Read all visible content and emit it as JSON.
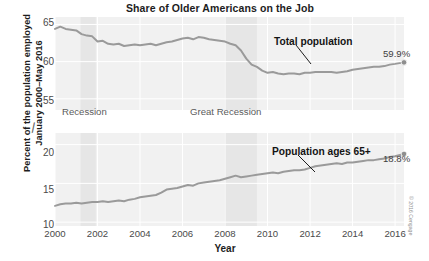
{
  "chart_data": {
    "type": "line",
    "title": "Share of Older Americans on the Job",
    "xlabel": "Year",
    "ylabel_line1": "Percent of the population employed",
    "ylabel_line2": "January 2000–May 2016",
    "grid": true,
    "legend_position": "inline-annotations",
    "xlim": [
      2000,
      2016.42
    ],
    "xticks": [
      "2000",
      "2002",
      "2004",
      "2006",
      "2008",
      "2010",
      "2012",
      "2014",
      "2016"
    ],
    "xtick_values": [
      2000,
      2002,
      2004,
      2006,
      2008,
      2010,
      2012,
      2014,
      2016
    ],
    "axis_break": {
      "symbol": "≈",
      "between": [
        25,
        50
      ],
      "note": "broken y-axis"
    },
    "upper_panel": {
      "ylim": [
        53.5,
        66
      ],
      "yticks": [
        "65",
        "60",
        "55"
      ],
      "ytick_values": [
        65,
        60,
        55
      ]
    },
    "lower_panel": {
      "ylim": [
        9.5,
        21.5
      ],
      "yticks": [
        "20",
        "15",
        "10"
      ],
      "ytick_values": [
        20,
        15,
        10
      ]
    },
    "shaded_bands": [
      {
        "label": "Recession",
        "x_start": 2001.2,
        "x_end": 2001.92
      },
      {
        "label": "Great Recession",
        "x_start": 2007.95,
        "x_end": 2009.5
      }
    ],
    "annotations": [
      {
        "text": "Total population",
        "series": "total_population",
        "x": 2011.9,
        "y": 58.3
      },
      {
        "text": "Population ages 65+",
        "series": "population_65_plus",
        "x": 2012.2,
        "y": 17.3
      }
    ],
    "end_labels": [
      {
        "text": "59.9%",
        "series": "total_population",
        "x": 2016.42,
        "y": 59.9
      },
      {
        "text": "18.8%",
        "series": "population_65_plus",
        "x": 2016.42,
        "y": 18.8
      }
    ],
    "series": [
      {
        "name": "Total population",
        "key": "total_population",
        "color": "#9a9a9a",
        "panel": "upper",
        "unit": "percent",
        "x": [
          2000.0,
          2000.25,
          2000.5,
          2000.75,
          2001.0,
          2001.25,
          2001.5,
          2001.75,
          2002.0,
          2002.25,
          2002.5,
          2002.75,
          2003.0,
          2003.25,
          2003.5,
          2003.75,
          2004.0,
          2004.25,
          2004.5,
          2004.75,
          2005.0,
          2005.25,
          2005.5,
          2005.75,
          2006.0,
          2006.25,
          2006.5,
          2006.75,
          2007.0,
          2007.25,
          2007.5,
          2007.75,
          2008.0,
          2008.25,
          2008.5,
          2008.75,
          2009.0,
          2009.25,
          2009.5,
          2009.75,
          2010.0,
          2010.25,
          2010.5,
          2010.75,
          2011.0,
          2011.25,
          2011.5,
          2011.75,
          2012.0,
          2012.25,
          2012.5,
          2012.75,
          2013.0,
          2013.25,
          2013.5,
          2013.75,
          2014.0,
          2014.25,
          2014.5,
          2014.75,
          2015.0,
          2015.25,
          2015.5,
          2015.75,
          2016.0,
          2016.42
        ],
        "values": [
          64.4,
          64.7,
          64.4,
          64.3,
          64.2,
          63.7,
          63.5,
          63.4,
          62.7,
          62.8,
          62.4,
          62.3,
          62.4,
          62.1,
          62.2,
          62.3,
          62.2,
          62.3,
          62.4,
          62.2,
          62.4,
          62.6,
          62.7,
          62.9,
          63.1,
          63.2,
          63.0,
          63.3,
          63.2,
          63.0,
          62.9,
          62.8,
          62.7,
          62.4,
          62.2,
          61.5,
          60.4,
          59.6,
          59.3,
          58.8,
          58.5,
          58.6,
          58.4,
          58.3,
          58.4,
          58.4,
          58.3,
          58.5,
          58.5,
          58.6,
          58.6,
          58.6,
          58.6,
          58.5,
          58.6,
          58.7,
          58.9,
          59.0,
          59.1,
          59.2,
          59.3,
          59.3,
          59.4,
          59.6,
          59.7,
          59.9
        ]
      },
      {
        "name": "Population ages 65+",
        "key": "population_65_plus",
        "color": "#9a9a9a",
        "panel": "lower",
        "unit": "percent",
        "x": [
          2000.0,
          2000.25,
          2000.5,
          2000.75,
          2001.0,
          2001.25,
          2001.5,
          2001.75,
          2002.0,
          2002.25,
          2002.5,
          2002.75,
          2003.0,
          2003.25,
          2003.5,
          2003.75,
          2004.0,
          2004.25,
          2004.5,
          2004.75,
          2005.0,
          2005.25,
          2005.5,
          2005.75,
          2006.0,
          2006.25,
          2006.5,
          2006.75,
          2007.0,
          2007.25,
          2007.5,
          2007.75,
          2008.0,
          2008.25,
          2008.5,
          2008.75,
          2009.0,
          2009.25,
          2009.5,
          2009.75,
          2010.0,
          2010.25,
          2010.5,
          2010.75,
          2011.0,
          2011.25,
          2011.5,
          2011.75,
          2012.0,
          2012.25,
          2012.5,
          2012.75,
          2013.0,
          2013.25,
          2013.5,
          2013.75,
          2014.0,
          2014.25,
          2014.5,
          2014.75,
          2015.0,
          2015.25,
          2015.5,
          2015.75,
          2016.0,
          2016.42
        ],
        "values": [
          12.1,
          12.3,
          12.4,
          12.4,
          12.5,
          12.4,
          12.5,
          12.6,
          12.6,
          12.7,
          12.6,
          12.7,
          12.8,
          12.7,
          12.9,
          13.0,
          13.2,
          13.3,
          13.4,
          13.5,
          13.8,
          14.2,
          14.3,
          14.4,
          14.6,
          14.8,
          14.7,
          15.0,
          15.1,
          15.2,
          15.3,
          15.4,
          15.6,
          15.8,
          16.0,
          15.8,
          15.9,
          16.0,
          16.1,
          16.2,
          16.3,
          16.4,
          16.3,
          16.5,
          16.6,
          16.7,
          16.7,
          16.8,
          17.0,
          17.2,
          17.3,
          17.4,
          17.5,
          17.6,
          17.5,
          17.7,
          17.7,
          17.8,
          17.9,
          18.0,
          18.0,
          18.1,
          18.2,
          18.4,
          18.5,
          18.8
        ]
      }
    ]
  },
  "credit": "© 2016 Cengage"
}
